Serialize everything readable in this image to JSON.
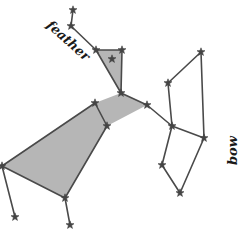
{
  "diagram": {
    "type": "constellation",
    "labels": [
      {
        "id": "feather",
        "text": "feather",
        "x": 68,
        "y": 40,
        "rotate": 42
      },
      {
        "id": "bow",
        "text": "bow",
        "x": 232,
        "y": 150,
        "rotate": -90
      }
    ],
    "colors": {
      "line": "#4a4a4a",
      "fill": "#a9a9a9",
      "star": "#444444",
      "text": "#1a1a1a"
    },
    "stars": [
      {
        "id": "s1",
        "x": 73,
        "y": 10
      },
      {
        "id": "s2",
        "x": 71,
        "y": 26
      },
      {
        "id": "s3",
        "x": 96,
        "y": 50
      },
      {
        "id": "s4",
        "x": 122,
        "y": 50
      },
      {
        "id": "s5",
        "x": 112,
        "y": 59
      },
      {
        "id": "s6",
        "x": 121,
        "y": 93
      },
      {
        "id": "s7",
        "x": 95,
        "y": 103
      },
      {
        "id": "s8",
        "x": 107,
        "y": 126
      },
      {
        "id": "s9",
        "x": 147,
        "y": 105
      },
      {
        "id": "s10",
        "x": 168,
        "y": 83
      },
      {
        "id": "s11",
        "x": 201,
        "y": 52
      },
      {
        "id": "s12",
        "x": 172,
        "y": 126
      },
      {
        "id": "s13",
        "x": 204,
        "y": 138
      },
      {
        "id": "s14",
        "x": 162,
        "y": 165
      },
      {
        "id": "s15",
        "x": 180,
        "y": 193
      },
      {
        "id": "s16",
        "x": 2,
        "y": 166
      },
      {
        "id": "s17",
        "x": 65,
        "y": 198
      },
      {
        "id": "s18",
        "x": 15,
        "y": 217
      },
      {
        "id": "s19",
        "x": 70,
        "y": 225
      }
    ],
    "shapes": [
      {
        "id": "feather-triangle",
        "points": [
          [
            96,
            50
          ],
          [
            122,
            50
          ],
          [
            121,
            93
          ]
        ]
      },
      {
        "id": "body-quad",
        "points": [
          [
            2,
            166
          ],
          [
            95,
            103
          ],
          [
            121,
            93
          ],
          [
            147,
            105
          ],
          [
            107,
            126
          ],
          [
            65,
            198
          ]
        ]
      }
    ],
    "lines": [
      [
        73,
        10,
        71,
        26
      ],
      [
        71,
        26,
        96,
        50
      ],
      [
        96,
        50,
        122,
        50
      ],
      [
        122,
        50,
        121,
        93
      ],
      [
        96,
        50,
        121,
        93
      ],
      [
        121,
        93,
        147,
        105
      ],
      [
        147,
        105,
        172,
        126
      ],
      [
        95,
        103,
        107,
        126
      ],
      [
        172,
        126,
        168,
        83
      ],
      [
        168,
        83,
        201,
        52
      ],
      [
        201,
        52,
        204,
        138
      ],
      [
        172,
        126,
        204,
        138
      ],
      [
        172,
        126,
        162,
        165
      ],
      [
        162,
        165,
        180,
        193
      ],
      [
        204,
        138,
        180,
        193
      ],
      [
        2,
        166,
        15,
        217
      ],
      [
        65,
        198,
        70,
        225
      ],
      [
        2,
        166,
        95,
        103
      ],
      [
        2,
        166,
        65,
        198
      ],
      [
        65,
        198,
        107,
        126
      ]
    ]
  }
}
